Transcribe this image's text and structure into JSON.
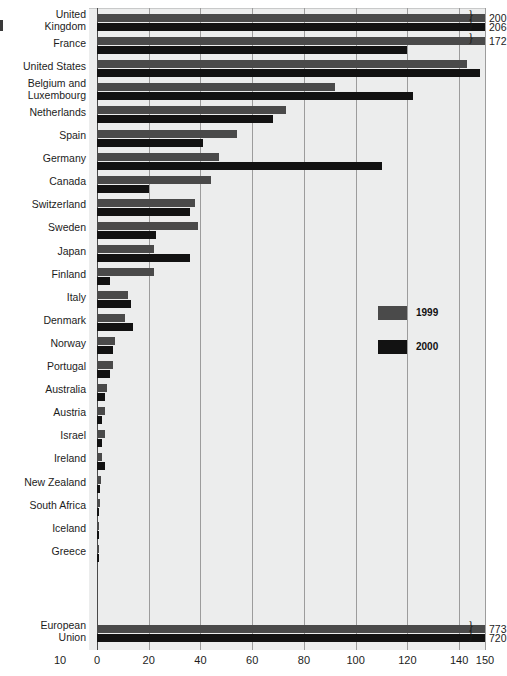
{
  "chart_data": {
    "type": "bar",
    "orientation": "horizontal",
    "title": "",
    "subtitle": "",
    "xlabel": "",
    "ylabel": "",
    "xlim": [
      0,
      150
    ],
    "xticks": [
      0,
      20,
      40,
      60,
      80,
      100,
      120,
      140,
      150
    ],
    "extra_tick_label": "10",
    "grid": true,
    "legend_position": "inside-right",
    "categories": [
      "United Kingdom",
      "France",
      "United States",
      "Belgium and Luxembourg",
      "Netherlands",
      "Spain",
      "Germany",
      "Canada",
      "Switzerland",
      "Sweden",
      "Japan",
      "Finland",
      "Italy",
      "Denmark",
      "Norway",
      "Portugal",
      "Australia",
      "Austria",
      "Israel",
      "Ireland",
      "New Zealand",
      "South Africa",
      "Iceland",
      "Greece",
      "European Union"
    ],
    "series": [
      {
        "name": "1999",
        "color": "#4a4a4a",
        "values": [
          200,
          172,
          143,
          92,
          73,
          54,
          47,
          44,
          38,
          39,
          22,
          22,
          12,
          11,
          7,
          6,
          4,
          3,
          3,
          2,
          1.5,
          1,
          0.8,
          0.5,
          773
        ]
      },
      {
        "name": "2000",
        "color": "#121212",
        "values": [
          206,
          120,
          148,
          122,
          68,
          41,
          110,
          20,
          36,
          23,
          36,
          5,
          13,
          14,
          6,
          5,
          3,
          2,
          2,
          3,
          1.2,
          0.8,
          0.6,
          0.4,
          720
        ]
      }
    ],
    "overflow_labels": [
      {
        "category": "United Kingdom",
        "series": "1999",
        "value": "200"
      },
      {
        "category": "United Kingdom",
        "series": "2000",
        "value": "206"
      },
      {
        "category": "France",
        "series": "1999",
        "value": "172"
      },
      {
        "category": "European Union",
        "series": "1999",
        "value": "773"
      },
      {
        "category": "European Union",
        "series": "2000",
        "value": "720"
      }
    ]
  },
  "legend": {
    "items": [
      {
        "label": "1999",
        "color": "#4a4a4a"
      },
      {
        "label": "2000",
        "color": "#121212"
      }
    ]
  },
  "axis": {
    "ticks": [
      "10",
      "0",
      "20",
      "40",
      "60",
      "80",
      "100",
      "120",
      "140",
      "150"
    ]
  }
}
